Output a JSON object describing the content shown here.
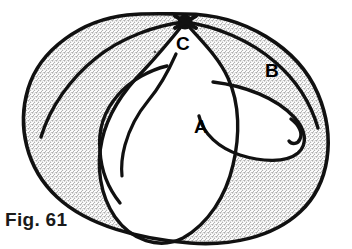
{
  "figure": {
    "caption": "Fig. 61",
    "labels": {
      "a": "A",
      "b": "B",
      "c": "C"
    },
    "node": {
      "name": "crossing-point",
      "label": "C",
      "x": 185,
      "y": 22
    },
    "colors": {
      "ink": "#111111",
      "shaded_region": "#e2e2e2",
      "unshaded_region": "#ffffff",
      "page_background": "#ffffff"
    },
    "regions": [
      {
        "id": "A",
        "label": "A",
        "fill": "unshaded",
        "description": "central white lobe"
      },
      {
        "id": "B",
        "label": "B",
        "fill": "shaded",
        "description": "outer stippled disk"
      },
      {
        "id": "C",
        "label": "C",
        "fill": "node",
        "description": "crossing point at top of disk"
      }
    ]
  }
}
